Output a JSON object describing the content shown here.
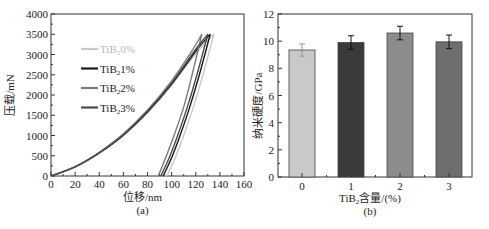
{
  "chart_data": [
    {
      "type": "line",
      "panel_label": "(a)",
      "title": "",
      "xlabel": "位移/nm",
      "ylabel": "压载/mN",
      "xlim": [
        0,
        160
      ],
      "ylim": [
        0,
        4000
      ],
      "xticks": [
        0,
        20,
        40,
        60,
        80,
        100,
        120,
        140,
        160
      ],
      "yticks": [
        0,
        500,
        1000,
        1500,
        2000,
        2500,
        3000,
        3500,
        4000
      ],
      "grid": false,
      "legend_position": "upper-left-inside",
      "series": [
        {
          "name": "TiB₂0%",
          "color": "#c8c8c8",
          "peak_depth": 135,
          "peak_load": 3500,
          "residual_depth": 96,
          "loading": [
            [
              0,
              0
            ],
            [
              20,
              220
            ],
            [
              40,
              560
            ],
            [
              60,
              1000
            ],
            [
              80,
              1560
            ],
            [
              100,
              2240
            ],
            [
              120,
              3020
            ],
            [
              135,
              3500
            ]
          ],
          "unloading": [
            [
              135,
              3500
            ],
            [
              126,
              2500
            ],
            [
              118,
              1700
            ],
            [
              110,
              1000
            ],
            [
              103,
              450
            ],
            [
              96,
              0
            ]
          ]
        },
        {
          "name": "TiB₂1%",
          "color": "#1a1a1a",
          "peak_depth": 132,
          "peak_load": 3500,
          "residual_depth": 93,
          "loading": [
            [
              0,
              0
            ],
            [
              20,
              225
            ],
            [
              40,
              570
            ],
            [
              60,
              1010
            ],
            [
              80,
              1580
            ],
            [
              100,
              2270
            ],
            [
              120,
              3080
            ],
            [
              132,
              3500
            ]
          ],
          "unloading": [
            [
              132,
              3500
            ],
            [
              123,
              2500
            ],
            [
              115,
              1700
            ],
            [
              107,
              1000
            ],
            [
              100,
              450
            ],
            [
              93,
              0
            ]
          ]
        },
        {
          "name": "TiB₂2%",
          "color": "#7a7a7a",
          "peak_depth": 125,
          "peak_load": 3500,
          "residual_depth": 89,
          "loading": [
            [
              0,
              0
            ],
            [
              20,
              230
            ],
            [
              40,
              585
            ],
            [
              60,
              1040
            ],
            [
              80,
              1630
            ],
            [
              100,
              2350
            ],
            [
              116,
              3050
            ],
            [
              125,
              3500
            ]
          ],
          "unloading": [
            [
              125,
              3500
            ],
            [
              117,
              2500
            ],
            [
              110,
              1700
            ],
            [
              102,
              1000
            ],
            [
              95,
              450
            ],
            [
              89,
              0
            ]
          ]
        },
        {
          "name": "TiB₂3%",
          "color": "#4a4a4a",
          "peak_depth": 130,
          "peak_load": 3500,
          "residual_depth": 91,
          "loading": [
            [
              0,
              0
            ],
            [
              20,
              228
            ],
            [
              40,
              575
            ],
            [
              60,
              1020
            ],
            [
              80,
              1600
            ],
            [
              100,
              2300
            ],
            [
              120,
              3130
            ],
            [
              130,
              3500
            ]
          ],
          "unloading": [
            [
              130,
              3500
            ],
            [
              121,
              2500
            ],
            [
              113,
              1700
            ],
            [
              105,
              1000
            ],
            [
              98,
              450
            ],
            [
              91,
              0
            ]
          ]
        }
      ]
    },
    {
      "type": "bar",
      "panel_label": "(b)",
      "title": "",
      "xlabel": "TiB₂含量/(%)",
      "ylabel": "纳米硬度/GPa",
      "categories": [
        "0",
        "1",
        "2",
        "3"
      ],
      "values": [
        9.35,
        9.9,
        10.6,
        9.95
      ],
      "errors": [
        0.45,
        0.5,
        0.5,
        0.5
      ],
      "bar_colors": [
        "#c9c9c9",
        "#3a3a3a",
        "#8c8c8c",
        "#6e6e6e"
      ],
      "ylim": [
        0,
        12
      ],
      "yticks": [
        0,
        2,
        4,
        6,
        8,
        10,
        12
      ],
      "grid": false
    }
  ]
}
